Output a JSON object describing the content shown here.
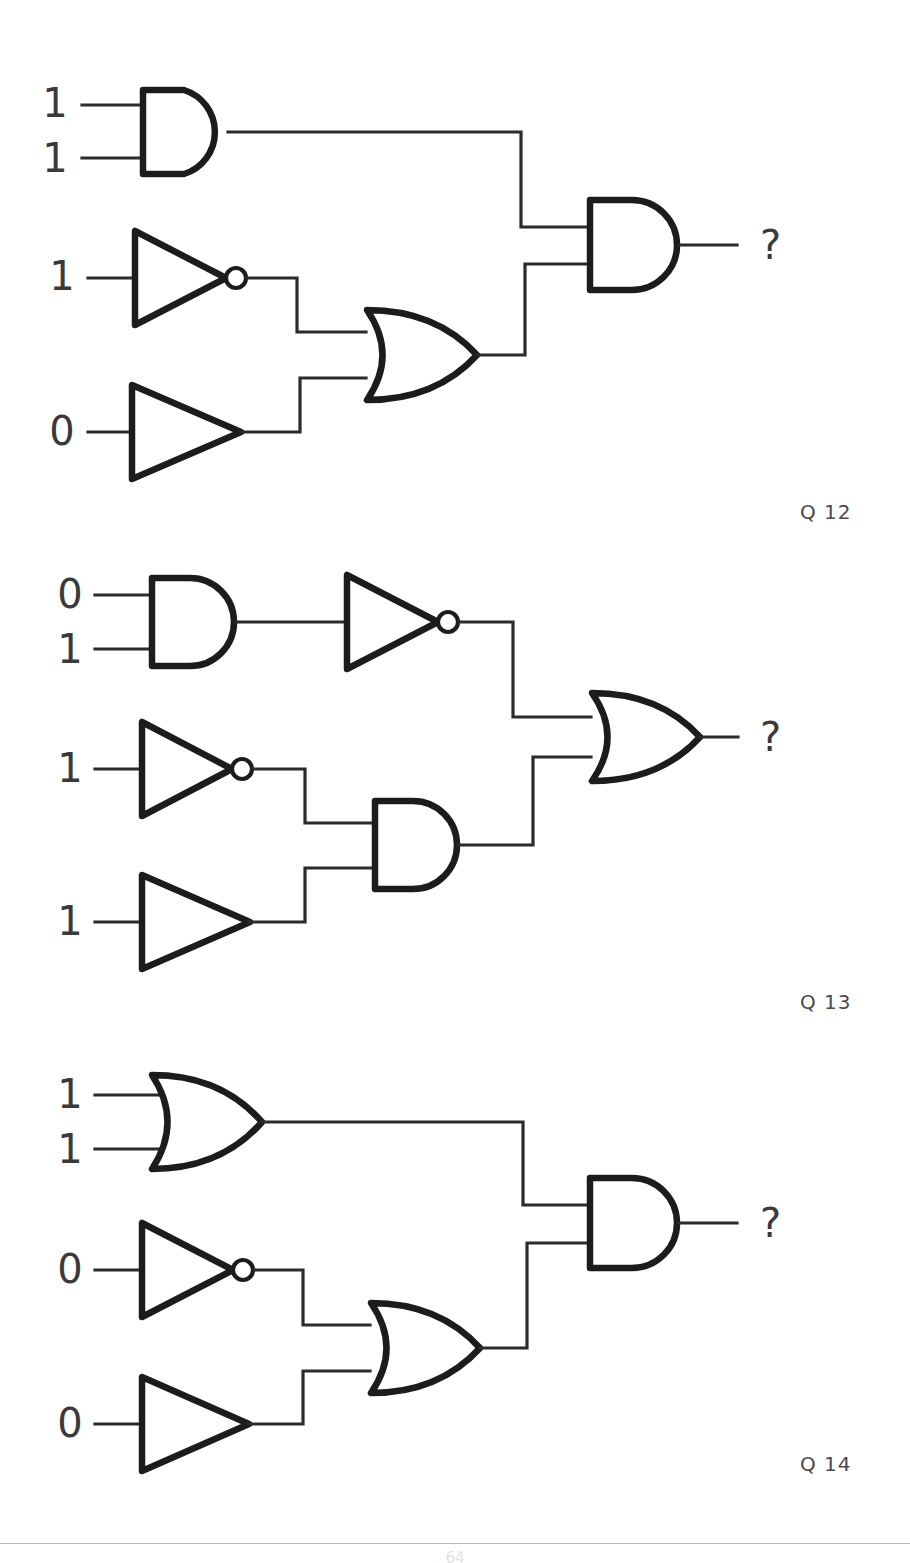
{
  "document": {
    "kind": "logic-gate-worksheet",
    "footer_page_number": "64"
  },
  "questions": [
    {
      "id": "q12",
      "label": "Q 12",
      "output_label": "?",
      "inputs": [
        "1",
        "1",
        "1",
        "0"
      ],
      "gates": [
        {
          "name": "and-gate-top",
          "type": "AND",
          "inputs": [
            "1",
            "1"
          ]
        },
        {
          "name": "not-gate-mid",
          "type": "NOT",
          "inputs": [
            "1"
          ]
        },
        {
          "name": "buffer-gate-bottom",
          "type": "BUFFER",
          "inputs": [
            "0"
          ]
        },
        {
          "name": "or-gate-mid",
          "type": "OR",
          "inputs": [
            "not-gate-mid",
            "buffer-gate-bottom"
          ]
        },
        {
          "name": "and-gate-output",
          "type": "AND",
          "inputs": [
            "and-gate-top",
            "or-gate-mid"
          ]
        }
      ]
    },
    {
      "id": "q13",
      "label": "Q 13",
      "output_label": "?",
      "inputs": [
        "0",
        "1",
        "1",
        "1"
      ],
      "gates": [
        {
          "name": "and-gate-top",
          "type": "AND",
          "inputs": [
            "0",
            "1"
          ]
        },
        {
          "name": "not-gate-top",
          "type": "NOT",
          "inputs": [
            "and-gate-top"
          ]
        },
        {
          "name": "not-gate-mid",
          "type": "NOT",
          "inputs": [
            "1"
          ]
        },
        {
          "name": "buffer-gate-bottom",
          "type": "BUFFER",
          "inputs": [
            "1"
          ]
        },
        {
          "name": "and-gate-mid",
          "type": "AND",
          "inputs": [
            "not-gate-mid",
            "buffer-gate-bottom"
          ]
        },
        {
          "name": "or-gate-output",
          "type": "OR",
          "inputs": [
            "not-gate-top",
            "and-gate-mid"
          ]
        }
      ]
    },
    {
      "id": "q14",
      "label": "Q 14",
      "output_label": "?",
      "inputs": [
        "1",
        "1",
        "0",
        "0"
      ],
      "gates": [
        {
          "name": "or-gate-top",
          "type": "OR",
          "inputs": [
            "1",
            "1"
          ]
        },
        {
          "name": "not-gate-mid",
          "type": "NOT",
          "inputs": [
            "0"
          ]
        },
        {
          "name": "buffer-gate-bottom",
          "type": "BUFFER",
          "inputs": [
            "0"
          ]
        },
        {
          "name": "or-gate-mid",
          "type": "OR",
          "inputs": [
            "not-gate-mid",
            "buffer-gate-bottom"
          ]
        },
        {
          "name": "and-gate-output",
          "type": "AND",
          "inputs": [
            "or-gate-top",
            "or-gate-mid"
          ]
        }
      ]
    }
  ]
}
